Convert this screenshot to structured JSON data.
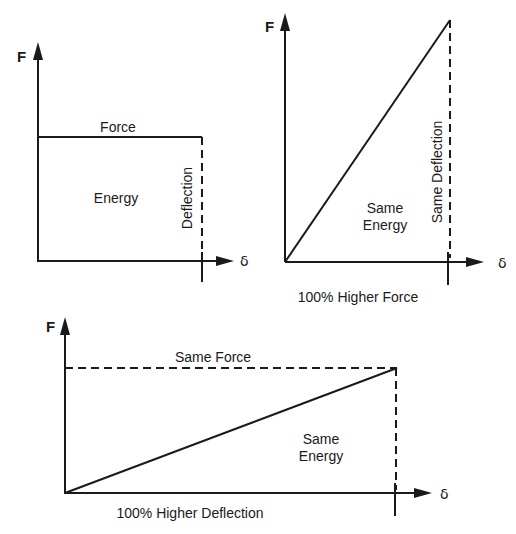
{
  "figure": {
    "panels": [
      {
        "id": "constant-force",
        "y_axis_label": "F",
        "x_axis_label": "δ",
        "labels": {
          "top": "Force",
          "area": "Energy",
          "vertical": "Deflection"
        }
      },
      {
        "id": "higher-force",
        "y_axis_label": "F",
        "x_axis_label": "δ",
        "labels": {
          "area_line1": "Same",
          "area_line2": "Energy",
          "vertical": "Same Deflection",
          "caption": "100% Higher Force"
        }
      },
      {
        "id": "higher-deflection",
        "y_axis_label": "F",
        "x_axis_label": "δ",
        "labels": {
          "top": "Same Force",
          "area_line1": "Same",
          "area_line2": "Energy",
          "caption": "100% Higher Deflection"
        }
      }
    ],
    "colors": {
      "ink": "#1a1a1a",
      "background": "#ffffff"
    }
  }
}
